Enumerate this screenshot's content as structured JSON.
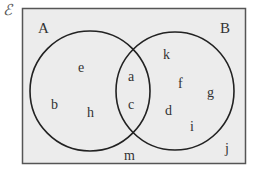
{
  "universal_set": {
    "symbol": "ℰ"
  },
  "sets": [
    {
      "name": "A",
      "label": "A"
    },
    {
      "name": "B",
      "label": "B"
    }
  ],
  "regions": {
    "only_A": [
      "e",
      "b",
      "h"
    ],
    "A_and_B": [
      "a",
      "c"
    ],
    "only_B": [
      "k",
      "f",
      "g",
      "d",
      "i"
    ],
    "outside": [
      "m",
      "j"
    ]
  },
  "elements": {
    "e": "e",
    "b": "b",
    "h": "h",
    "a": "a",
    "c": "c",
    "k": "k",
    "f": "f",
    "g": "g",
    "d": "d",
    "i": "i",
    "m": "m",
    "j": "j"
  },
  "colors": {
    "background": "#ececec",
    "border": "#555555",
    "circle_stroke": "#222222",
    "text": "#333333"
  }
}
